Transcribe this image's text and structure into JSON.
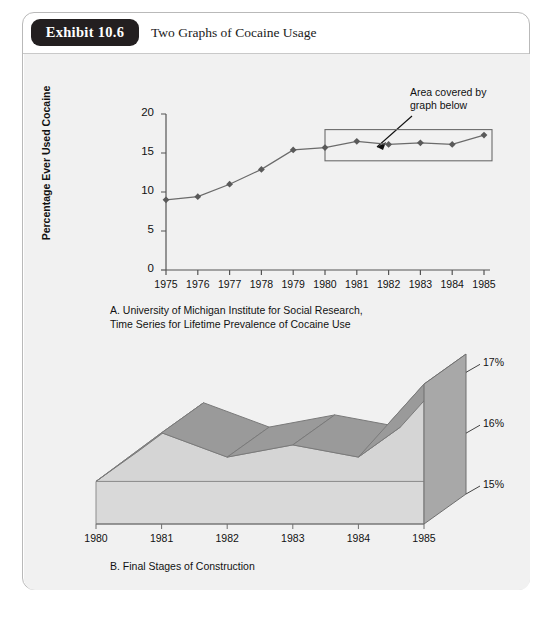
{
  "exhibit": {
    "badge_label": "Exhibit 10.6",
    "title": "Two Graphs of Cocaine Usage"
  },
  "graph_a": {
    "callout_line1": "Area covered by",
    "callout_line2": "graph below",
    "caption_line1": "A. University of Michigan Institute for Social Research,",
    "caption_line2": "Time Series for Lifetime Prevalence of Cocaine Use"
  },
  "graph_b": {
    "caption": "B. Final Stages of Construction"
  },
  "colors": {
    "badge_background": "#231f20",
    "panel_background": "#f1f1f1",
    "card_border": "#b9b9b9",
    "line_series": "#6b6b6b",
    "marker": "#5a5a5a",
    "ribbon_top": "#9a9a9a",
    "ribbon_face": "#d5d5d5",
    "base_fill": "#d9d9d9",
    "wall_fill": "#a8a8a8",
    "axis": "#555555"
  },
  "chart_data": [
    {
      "type": "line",
      "id": "graph-a",
      "title": "A. University of Michigan Institute for Social Research, Time Series for Lifetime Prevalence of Cocaine Use",
      "xlabel": "",
      "ylabel": "Percentage Ever Used Cocaine",
      "categories": [
        1975,
        1976,
        1977,
        1978,
        1979,
        1980,
        1981,
        1982,
        1983,
        1984,
        1985
      ],
      "x_tick_labels": [
        "1975",
        "1976",
        "1977",
        "1978",
        "1979",
        "1980",
        "1981",
        "1982",
        "1983",
        "1984",
        "1985"
      ],
      "values": [
        9.0,
        9.4,
        11.0,
        12.9,
        15.4,
        15.7,
        16.5,
        16.1,
        16.3,
        16.1,
        17.3
      ],
      "ylim": [
        0,
        20
      ],
      "y_tick_labels": [
        "0",
        "5",
        "10",
        "15",
        "20"
      ],
      "y_ticks": [
        0,
        5,
        10,
        15,
        20
      ],
      "grid": false,
      "legend": "none",
      "markers": true,
      "annotations": [
        {
          "text": "Area covered by graph below",
          "type": "callout-arrow",
          "target_region": {
            "x_from": 1980,
            "x_to": 1985,
            "y_from": 14,
            "y_to": 18
          }
        },
        {
          "type": "highlight-rectangle",
          "x_from": 1980,
          "x_to": 1985,
          "y_from": 14,
          "y_to": 18
        }
      ]
    },
    {
      "type": "area",
      "id": "graph-b",
      "title": "B. Final Stages of Construction",
      "subtitle": "3-D perspective area chart, expanded scale of highlighted region",
      "xlabel": "",
      "ylabel": "",
      "categories": [
        1980,
        1981,
        1982,
        1983,
        1984,
        1985
      ],
      "x_tick_labels": [
        "1980",
        "1981",
        "1982",
        "1983",
        "1984",
        "1985"
      ],
      "values": [
        15.7,
        16.5,
        16.1,
        16.3,
        16.1,
        17.3
      ],
      "ylim": [
        15,
        17.4
      ],
      "y_tick_labels": [
        "15%",
        "16%",
        "17%"
      ],
      "y_ticks": [
        15,
        16,
        17
      ],
      "grid": false,
      "legend": "none",
      "three_d": true
    }
  ]
}
